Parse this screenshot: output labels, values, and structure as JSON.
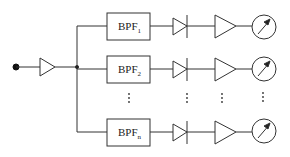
{
  "diagram": {
    "type": "block-diagram",
    "input": {
      "label": "input-node"
    },
    "channels": [
      {
        "filter_label": "BPF",
        "filter_subscript": "1"
      },
      {
        "filter_label": "BPF",
        "filter_subscript": "2"
      },
      {
        "filter_label": "BPF",
        "filter_subscript": "n"
      }
    ],
    "ellipsis": "⋮",
    "colors": {
      "stroke": "#333333",
      "background": "#ffffff"
    }
  }
}
